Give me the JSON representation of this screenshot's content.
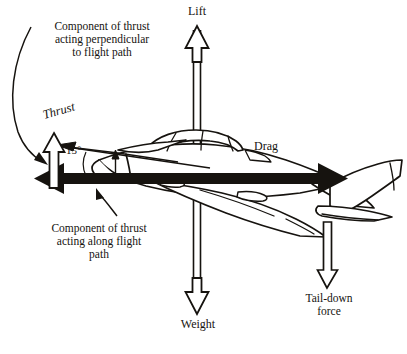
{
  "diagram": {
    "background_color": "#ffffff",
    "ink_color": "#16130f",
    "labels": {
      "lift": "Lift",
      "weight": "Weight",
      "drag": "Drag",
      "thrust": "Thrust",
      "angle": "15°",
      "tail_down_force_line1": "Tail-down",
      "tail_down_force_line2": "force",
      "perpendicular_component_line1": "Component of thrust",
      "perpendicular_component_line2": "acting perpendicular",
      "perpendicular_component_line3": "to flight path",
      "along_component_line1": "Component of thrust",
      "along_component_line2": "acting along flight",
      "along_component_line3": "path"
    },
    "forces": [
      {
        "name": "lift",
        "label": "Lift",
        "direction": "up",
        "style": "hollow-outline-arrow"
      },
      {
        "name": "weight",
        "label": "Weight",
        "direction": "down",
        "style": "hollow-outline-arrow"
      },
      {
        "name": "drag",
        "label": "Drag",
        "direction": "right",
        "style": "solid-black-arrow"
      },
      {
        "name": "thrust",
        "label": "Thrust",
        "direction": "left",
        "style": "solid-black-arrow"
      },
      {
        "name": "thrust-perpendicular-component",
        "label": "Component of thrust acting perpendicular to flight path",
        "direction": "up",
        "style": "hollow-outline-arrow"
      },
      {
        "name": "thrust-along-component",
        "label": "Component of thrust acting along flight path",
        "direction": "left",
        "style": "solid-black-arrow"
      },
      {
        "name": "tail-down-force",
        "label": "Tail-down force",
        "direction": "down",
        "style": "hollow-outline-arrow"
      }
    ],
    "angle_value": "15°"
  }
}
